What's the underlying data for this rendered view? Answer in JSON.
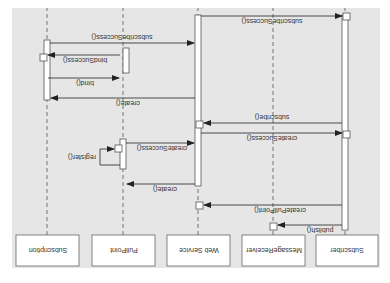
{
  "diagram": {
    "type": "uml-sequence-diagram",
    "orientation": "rotated-180",
    "background": "#e6e6e6",
    "participants": [
      {
        "id": "subscriber",
        "label": "Subscriber"
      },
      {
        "id": "message_receiver",
        "label": "MessageReceiver"
      },
      {
        "id": "web_service",
        "label": "Web Service"
      },
      {
        "id": "pull_point",
        "label": "PullPoint"
      },
      {
        "id": "subscription",
        "label": "Subscription"
      }
    ],
    "messages": [
      {
        "from": "subscriber",
        "to": "message_receiver",
        "label": "publish()"
      },
      {
        "from": "subscriber",
        "to": "web_service",
        "label": "createPullPoint()"
      },
      {
        "from": "web_service",
        "to": "pull_point",
        "label": "create()"
      },
      {
        "from": "pull_point",
        "to": "pull_point",
        "label": "register()"
      },
      {
        "from": "pull_point",
        "to": "web_service",
        "label": "createSuccess()"
      },
      {
        "from": "web_service",
        "to": "subscriber",
        "label": "createSuccess()"
      },
      {
        "from": "subscriber",
        "to": "web_service",
        "label": "subscribe()"
      },
      {
        "from": "web_service",
        "to": "subscription",
        "label": "create()"
      },
      {
        "from": "subscription",
        "to": "pull_point",
        "label": "bind()"
      },
      {
        "from": "pull_point",
        "to": "subscription",
        "label": "bindSuccess()"
      },
      {
        "from": "subscription",
        "to": "web_service",
        "label": "subscribeSuccess()"
      },
      {
        "from": "web_service",
        "to": "subscriber",
        "label": "subscribeSuccess()"
      }
    ]
  }
}
